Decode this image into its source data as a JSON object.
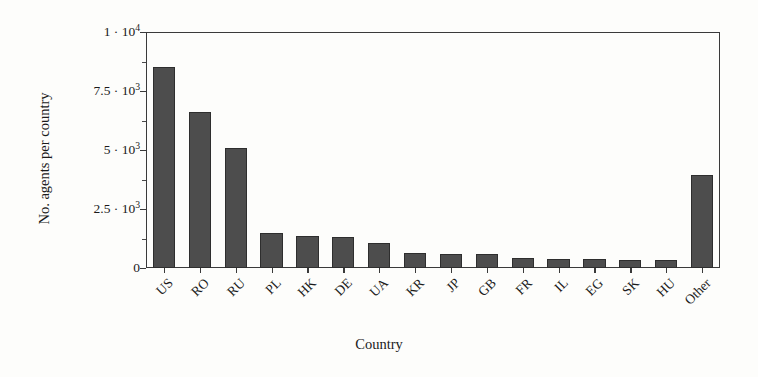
{
  "chart_data": {
    "type": "bar",
    "title": "",
    "xlabel": "Country",
    "ylabel": "No. agents per country",
    "categories": [
      "US",
      "RO",
      "RU",
      "PL",
      "HK",
      "DE",
      "UA",
      "KR",
      "JP",
      "GB",
      "FR",
      "IL",
      "EG",
      "SK",
      "HU",
      "Other"
    ],
    "values": [
      8500,
      6600,
      5100,
      1500,
      1350,
      1330,
      1050,
      620,
      600,
      600,
      420,
      400,
      390,
      340,
      330,
      3950
    ],
    "ylim": [
      0,
      10000
    ],
    "yticks": [
      0,
      2500,
      5000,
      7500,
      10000
    ],
    "ytick_labels": [
      "0",
      "2.5 · 10³",
      "5 · 10³",
      "7.5 · 10³",
      "1 · 10⁴"
    ],
    "ytick_labels_parts": [
      {
        "mantissa": "0",
        "exponent": ""
      },
      {
        "mantissa": "2.5 · 10",
        "exponent": "3"
      },
      {
        "mantissa": "5 · 10",
        "exponent": "3"
      },
      {
        "mantissa": "7.5 · 10",
        "exponent": "3"
      },
      {
        "mantissa": "1 · 10",
        "exponent": "4"
      }
    ],
    "grid": false,
    "legend": null,
    "bar_color": "#4d4d4d",
    "bar_edge_color": "#2e2e2e",
    "axis_color": "#3a3a3a",
    "background_color": "#fdfdfb",
    "xtick_rotation_deg": -45
  }
}
